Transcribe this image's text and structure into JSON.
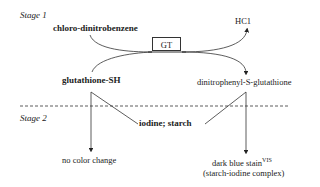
{
  "stage1": {
    "label": "Stage 1",
    "reactant1": "chloro-dinitrobenzene",
    "reactant2": "glutathione-SH",
    "enzyme": "GT",
    "byproduct": "HC1",
    "product": "dinitrophenyl-S-glutathione"
  },
  "stage2": {
    "label": "Stage 2",
    "reagent": "iodine; starch",
    "left_result": "no color change",
    "right_result": "dark blue stain",
    "right_result_superscript": "VIS",
    "right_result_note": "(starch-iodine complex)"
  },
  "colors": {
    "ink": "#222222",
    "background": "#ffffff"
  }
}
